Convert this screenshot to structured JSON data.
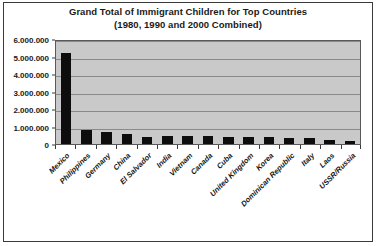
{
  "chart_data": {
    "type": "bar",
    "title": "Grand Total of Immigrant Children for Top Countries (1980, 1990 and 2000 Combined)",
    "title_line1": "Grand Total of Immigrant Children for Top Countries",
    "title_line2": "(1980, 1990 and 2000 Combined)",
    "xlabel": "",
    "ylabel": "",
    "ylim": [
      0,
      6000000
    ],
    "grid": true,
    "legend": false,
    "bar_color": "#0d0d0d",
    "plot_background": "#c9c9c9",
    "y_ticks": [
      0,
      1000000,
      2000000,
      3000000,
      4000000,
      5000000,
      6000000
    ],
    "y_tick_labels": [
      "0",
      "1.000.000",
      "2.000.000",
      "3.000.000",
      "4.000.000",
      "5.000.000",
      "6.000.000"
    ],
    "categories": [
      "Mexico",
      "Philippines",
      "Germany",
      "China",
      "El Salvador",
      "India",
      "Vietnam",
      "Canada",
      "Cuba",
      "United Kingdom",
      "Korea",
      "Dominican Republic",
      "Italy",
      "Laos",
      "USSR/Russia"
    ],
    "values": [
      5200000,
      820000,
      700000,
      560000,
      420000,
      480000,
      450000,
      440000,
      420000,
      400000,
      390000,
      350000,
      330000,
      250000,
      150000
    ]
  }
}
